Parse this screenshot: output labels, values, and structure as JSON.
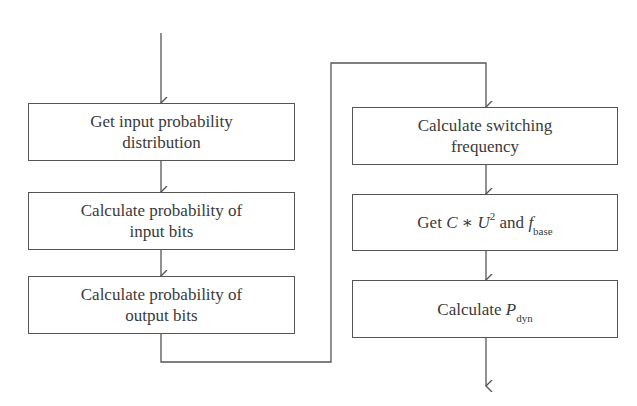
{
  "diagram": {
    "type": "flowchart",
    "left_column": [
      {
        "id": "L1",
        "lines": [
          "Get input probability",
          "distribution"
        ]
      },
      {
        "id": "L2",
        "lines": [
          "Calculate probability of",
          "input bits"
        ]
      },
      {
        "id": "L3",
        "lines": [
          "Calculate probability of",
          "output bits"
        ]
      }
    ],
    "right_column": [
      {
        "id": "R1",
        "lines": [
          "Calculate switching",
          "frequency"
        ]
      },
      {
        "id": "R2",
        "parts": {
          "prefix": "Get ",
          "c": "C",
          "op": " ∗ ",
          "u": "U",
          "exp": "2",
          "mid": " and ",
          "f": "f",
          "f_sub": "base"
        }
      },
      {
        "id": "R3",
        "parts": {
          "prefix": "Calculate ",
          "p": "P",
          "p_sub": "dyn"
        }
      }
    ],
    "edges": [
      {
        "from": "start",
        "to": "L1"
      },
      {
        "from": "L1",
        "to": "L2"
      },
      {
        "from": "L2",
        "to": "L3"
      },
      {
        "from": "L3",
        "to": "R1",
        "routing": "elbow connector"
      },
      {
        "from": "R1",
        "to": "R2"
      },
      {
        "from": "R2",
        "to": "R3"
      },
      {
        "from": "R3",
        "to": "end"
      }
    ],
    "colors": {
      "stroke": "#555555",
      "text": "#3a3a3a",
      "background": "#ffffff"
    }
  }
}
